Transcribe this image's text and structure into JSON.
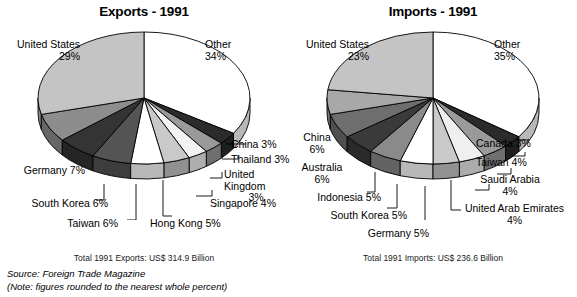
{
  "figure": {
    "source_line": "Source: Foreign Trade Magazine",
    "note_line": "(Note: figures rounded to the nearest whole percent)"
  },
  "chart_data": [
    {
      "type": "pie",
      "title": "Exports - 1991",
      "total_label": "Total 1991 Exports: US$ 314.9 Billion",
      "total_value": 314.9,
      "total_units": "US$ Billion",
      "units": "percent",
      "categories": [
        "Other",
        "China",
        "Thailand",
        "United Kingdom",
        "Singapore",
        "Hong Kong",
        "Taiwan",
        "South Korea",
        "Germany",
        "United States"
      ],
      "values": [
        34,
        3,
        3,
        3,
        4,
        5,
        6,
        6,
        7,
        29
      ],
      "labels": [
        {
          "name": "Other",
          "pct": "34%",
          "text": "Other",
          "pct_text": "34%"
        },
        {
          "name": "China",
          "pct": "3%",
          "text": "China 3%"
        },
        {
          "name": "Thailand",
          "pct": "3%",
          "text": "Thailand 3%"
        },
        {
          "name": "United Kingdom",
          "pct": "3%",
          "text": "United Kingdom",
          "pct_text": "3%"
        },
        {
          "name": "Singapore",
          "pct": "4%",
          "text": "Singapore 4%"
        },
        {
          "name": "Hong Kong",
          "pct": "5%",
          "text": "Hong Kong  5%"
        },
        {
          "name": "Taiwan",
          "pct": "6%",
          "text": "Taiwan  6%"
        },
        {
          "name": "South Korea",
          "pct": "6%",
          "text": "South Korea 6%"
        },
        {
          "name": "Germany",
          "pct": "7%",
          "text": "Germany 7%"
        },
        {
          "name": "United States",
          "pct": "29%",
          "text": "United States",
          "pct_text": "29%"
        }
      ],
      "slice_colors": [
        "#ffffff",
        "#2b2b2b",
        "#9a9a9a",
        "#f2f2f2",
        "#c9c9c9",
        "#ffffff",
        "#555555",
        "#343434",
        "#8d8d8d",
        "#c4c4c4"
      ]
    },
    {
      "type": "pie",
      "title": "Imports - 1991",
      "total_label": "Total 1991 Imports: US$ 236.6 Billion",
      "total_value": 236.6,
      "total_units": "US$ Billion",
      "units": "percent",
      "categories": [
        "Other",
        "Canada",
        "Taiwan",
        "Saudi Arabia",
        "United Arab Emirates",
        "Germany",
        "South Korea",
        "Indonesia",
        "Australia",
        "China",
        "United States"
      ],
      "values": [
        35,
        3,
        4,
        4,
        4,
        5,
        5,
        5,
        6,
        6,
        23
      ],
      "labels": [
        {
          "name": "Other",
          "pct": "35%",
          "text": "Other",
          "pct_text": "35%"
        },
        {
          "name": "Canada",
          "pct": "3%",
          "text": "Canada 3%"
        },
        {
          "name": "Taiwan",
          "pct": "4%",
          "text": "Taiwan 4%"
        },
        {
          "name": "Saudi Arabia",
          "pct": "4%",
          "text": "Saudi Arabia",
          "pct_text": "4%"
        },
        {
          "name": "United Arab Emirates",
          "pct": "4%",
          "text": "United Arab Emirates",
          "pct_text": "4%"
        },
        {
          "name": "Germany",
          "pct": "5%",
          "text": "Germany 5%"
        },
        {
          "name": "South Korea",
          "pct": "5%",
          "text": "South Korea 5%"
        },
        {
          "name": "Indonesia",
          "pct": "5%",
          "text": "Indonesia 5%"
        },
        {
          "name": "Australia",
          "pct": "6%",
          "text": "Australia",
          "pct_text": "6%"
        },
        {
          "name": "China",
          "pct": "6%",
          "text": "China",
          "pct_text": "6%"
        },
        {
          "name": "United States",
          "pct": "23%",
          "text": "United States",
          "pct_text": "23%"
        }
      ],
      "slice_colors": [
        "#ffffff",
        "#2b2b2b",
        "#9a9a9a",
        "#efefef",
        "#c9c9c9",
        "#ffffff",
        "#8a8a8a",
        "#3a3a3a",
        "#6e6e6e",
        "#a8a8a8",
        "#c4c4c4"
      ]
    }
  ]
}
